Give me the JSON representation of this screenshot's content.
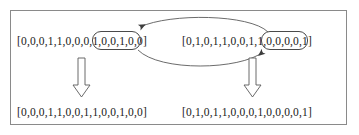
{
  "figure": {
    "border_color": "#8a8a8a",
    "text_color": "#1a1a1a",
    "box_color": "#4a4a4a",
    "arrow_color": "#4a4a4a"
  },
  "parents": {
    "a": {
      "label": "parent-a",
      "prefix": "[0,0,0,1,1,0,0,",
      "segment": "0,1,0,0,",
      "suffix": "1,0,0]",
      "full": "[0,0,0,1,1,0,0,0,1,0,0,1,0,0]",
      "bits": [
        0,
        0,
        0,
        1,
        1,
        0,
        0,
        0,
        1,
        0,
        0,
        1,
        0,
        0
      ],
      "segment_bits": [
        0,
        1,
        0,
        0
      ],
      "segment_start_index": 7,
      "segment_end_index": 10
    },
    "b": {
      "label": "parent-b",
      "prefix": "[0,1,0,1,1,0,0,",
      "segment": "1,1,0,0,",
      "suffix": "0,0,1]",
      "full": "[0,1,0,1,1,0,0,1,1,0,0,0,0,1]",
      "bits": [
        0,
        1,
        0,
        1,
        1,
        0,
        0,
        1,
        1,
        0,
        0,
        0,
        0,
        1
      ],
      "segment_bits": [
        1,
        1,
        0,
        0
      ],
      "segment_start_index": 7,
      "segment_end_index": 10
    }
  },
  "children": {
    "a": {
      "label": "child-a",
      "full": "[0,0,0,1,1,0,0,1,1,0,0,1,0,0]",
      "bits": [
        0,
        0,
        0,
        1,
        1,
        0,
        0,
        1,
        1,
        0,
        0,
        1,
        0,
        0
      ]
    },
    "b": {
      "label": "child-b",
      "full": "[0,1,0,1,1,0,0,0,1,0,0,0,0,1]",
      "bits": [
        0,
        1,
        0,
        1,
        1,
        0,
        0,
        0,
        1,
        0,
        0,
        0,
        0,
        1
      ]
    }
  },
  "arrows": {
    "swap_top": {
      "name": "swap-arc-right-to-left",
      "direction": "right-to-left",
      "description": "curved arc carrying segment from parent-b into parent-a"
    },
    "swap_bottom": {
      "name": "swap-arc-left-to-right",
      "direction": "left-to-right",
      "description": "curved arc carrying segment from parent-a into parent-b"
    },
    "produce_left": {
      "name": "produce-child-a-arrow",
      "direction": "down"
    },
    "produce_right": {
      "name": "produce-child-b-arrow",
      "direction": "down"
    }
  }
}
